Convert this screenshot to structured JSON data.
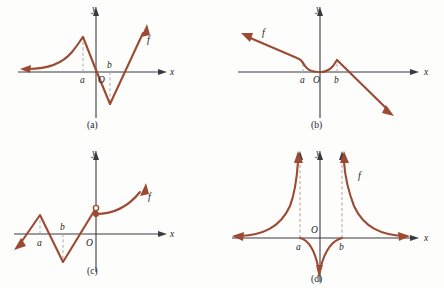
{
  "figure": {
    "title": "",
    "stroke_color": "#9c4a33",
    "axis_color": "#3c3b44",
    "dash_color": "#a9a8ad",
    "background": "#fdfdfb"
  },
  "panels": [
    {
      "id": "a",
      "caption": "(a)",
      "axis_labels": {
        "x": "x",
        "y": "y",
        "origin": "O"
      },
      "point_labels": [
        {
          "name": "a",
          "text": "a"
        },
        {
          "name": "b",
          "text": "b"
        }
      ],
      "curve_label": "f",
      "description": "Curve rises from far left along the x-axis, increases to a local maximum above x=a, drops steeply with a corner through the origin to a sharp minimum below x=b, then rises steeply to the upper right."
    },
    {
      "id": "b",
      "caption": "(b)",
      "axis_labels": {
        "x": "x",
        "y": "y",
        "origin": "O"
      },
      "point_labels": [
        {
          "name": "a",
          "text": "a"
        },
        {
          "name": "b",
          "text": "b"
        }
      ],
      "curve_label": "f",
      "description": "Straight ray from upper left descends to a corner at x=a, flattens into a shallow valley touching the x-axis at the origin, rises to a cusp peak at x=b, then falls steeply to the lower right."
    },
    {
      "id": "c",
      "caption": "(c)",
      "axis_labels": {
        "x": "x",
        "y": "y",
        "origin": "O"
      },
      "point_labels": [
        {
          "name": "a",
          "text": "a"
        },
        {
          "name": "b",
          "text": "b"
        }
      ],
      "curve_label": "f",
      "description": "Line rises from lower left to a corner peak above x=a, drops to a sharp minimum below x=b, rises crossing the x-axis to an open circle at the y-axis; from a filled point just below, a smooth curve rises to the upper right."
    },
    {
      "id": "d",
      "caption": "(d)",
      "axis_labels": {
        "x": "x",
        "y": "y",
        "origin": "O"
      },
      "point_labels": [
        {
          "name": "a",
          "text": "a"
        },
        {
          "name": "b",
          "text": "b"
        }
      ],
      "curve_label": "f",
      "description": "Two branches approach the x-axis at far left and far right and rise to plus infinity along vertical asymptotes at x=a and x=b; the middle branch runs from a and b down to minus infinity along the y-axis."
    }
  ]
}
